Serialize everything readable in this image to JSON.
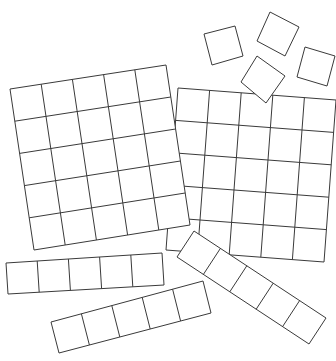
{
  "diagram": {
    "stroke_color": "#3a3a3a",
    "fill_color": "#ffffff",
    "pieces": [
      {
        "id": "flat-2",
        "type": "grid",
        "rows": 5,
        "cols": 5,
        "corners": [
          [
            178,
            88
          ],
          [
            336,
            100
          ],
          [
            324,
            262
          ],
          [
            166,
            250
          ]
        ]
      },
      {
        "id": "flat-1",
        "type": "grid",
        "rows": 5,
        "cols": 5,
        "corners": [
          [
            10,
            89
          ],
          [
            166,
            65
          ],
          [
            190,
            225
          ],
          [
            34,
            250
          ]
        ]
      },
      {
        "id": "unit-1",
        "type": "grid",
        "rows": 1,
        "cols": 1,
        "corners": [
          [
            204,
            34
          ],
          [
            235,
            26
          ],
          [
            243,
            56
          ],
          [
            212,
            65
          ]
        ]
      },
      {
        "id": "unit-2",
        "type": "grid",
        "rows": 1,
        "cols": 1,
        "corners": [
          [
            270,
            12
          ],
          [
            299,
            27
          ],
          [
            285,
            56
          ],
          [
            257,
            41
          ]
        ]
      },
      {
        "id": "unit-3",
        "type": "grid",
        "rows": 1,
        "cols": 1,
        "corners": [
          [
            305,
            47
          ],
          [
            335,
            56
          ],
          [
            327,
            86
          ],
          [
            297,
            77
          ]
        ]
      },
      {
        "id": "unit-4",
        "type": "grid",
        "rows": 1,
        "cols": 1,
        "corners": [
          [
            257,
            56
          ],
          [
            285,
            76
          ],
          [
            266,
            103
          ],
          [
            241,
            82
          ]
        ]
      },
      {
        "id": "strip-1",
        "type": "grid",
        "rows": 1,
        "cols": 5,
        "corners": [
          [
            6,
            263
          ],
          [
            162,
            253
          ],
          [
            164,
            285
          ],
          [
            8,
            294
          ]
        ]
      },
      {
        "id": "strip-2",
        "type": "grid",
        "rows": 1,
        "cols": 5,
        "corners": [
          [
            51,
            322
          ],
          [
            203,
            281
          ],
          [
            211,
            313
          ],
          [
            59,
            353
          ]
        ]
      },
      {
        "id": "strip-3",
        "type": "grid",
        "rows": 1,
        "cols": 5,
        "corners": [
          [
            194,
            231
          ],
          [
            326,
            318
          ],
          [
            309,
            344
          ],
          [
            177,
            257
          ]
        ]
      }
    ],
    "counts": {
      "flats": 2,
      "strips": 3,
      "units": 4,
      "squares_per_flat": 25,
      "squares_per_strip": 5
    }
  }
}
